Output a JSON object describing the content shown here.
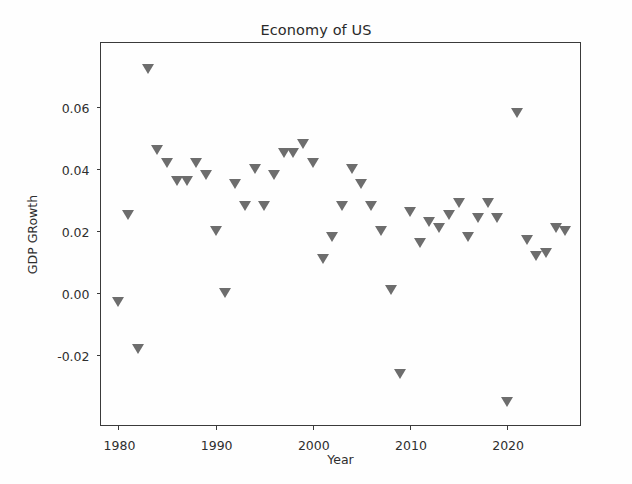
{
  "chart_data": {
    "type": "scatter",
    "title": "Economy of US",
    "xlabel": "Year",
    "ylabel": "GDP GRowth",
    "marker": "triangle-down",
    "marker_color": "#6d6d6d",
    "grid": false,
    "legend": null,
    "xlim": [
      1978.2,
      2027.5
    ],
    "ylim": [
      -0.0425,
      0.0805
    ],
    "xticks": [
      1980,
      1990,
      2000,
      2010,
      2020
    ],
    "xtick_labels": [
      "1980",
      "1990",
      "2000",
      "2010",
      "2020"
    ],
    "yticks": [
      -0.02,
      0.0,
      0.02,
      0.04,
      0.06
    ],
    "ytick_labels": [
      "-0.02",
      "0.00",
      "0.02",
      "0.04",
      "0.06"
    ],
    "x": [
      1980,
      1981,
      1982,
      1983,
      1984,
      1985,
      1986,
      1987,
      1988,
      1989,
      1990,
      1991,
      1992,
      1993,
      1994,
      1995,
      1996,
      1997,
      1998,
      1999,
      2000,
      2001,
      2002,
      2003,
      2004,
      2005,
      2006,
      2007,
      2008,
      2009,
      2010,
      2011,
      2012,
      2013,
      2014,
      2015,
      2016,
      2017,
      2018,
      2019,
      2020,
      2021,
      2022,
      2023,
      2024,
      2025,
      2026
    ],
    "y": [
      -0.003,
      0.025,
      -0.018,
      0.072,
      0.046,
      0.042,
      0.036,
      0.036,
      0.042,
      0.038,
      0.02,
      0.0,
      0.035,
      0.028,
      0.04,
      0.028,
      0.038,
      0.045,
      0.045,
      0.048,
      0.042,
      0.011,
      0.018,
      0.028,
      0.04,
      0.035,
      0.028,
      0.02,
      0.001,
      -0.026,
      0.026,
      0.016,
      0.023,
      0.021,
      0.025,
      0.029,
      0.018,
      0.024,
      0.029,
      0.024,
      -0.035,
      0.058,
      0.017,
      0.012,
      0.013,
      0.021,
      0.02
    ],
    "series_name": "GDP GRowth"
  }
}
